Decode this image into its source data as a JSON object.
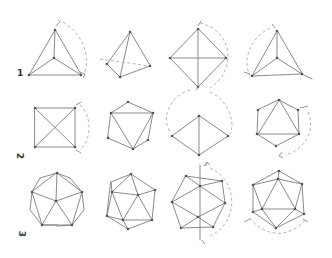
{
  "figure": {
    "rows": [
      {
        "label": "1",
        "solid": "tetrahedron",
        "views": 4
      },
      {
        "label": "2",
        "solid": "octahedron",
        "views": 4
      },
      {
        "label": "3",
        "solid": "icosahedron",
        "views": 4
      }
    ],
    "colors": {
      "background": "#ffffff",
      "edges": "#7d7d7d",
      "dashed_arcs": "#b5b5b5",
      "vertices": "#555555"
    }
  }
}
